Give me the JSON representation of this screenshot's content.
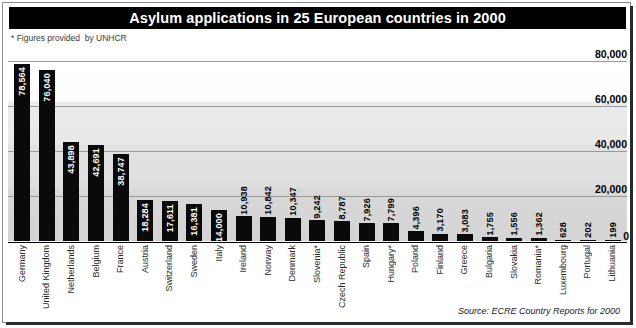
{
  "title": "Asylum applications in 25 European countries in 2000",
  "footnote": "* Figures provided  by UNHCR",
  "source": "Source: ECRE Country Reports for 2000",
  "chart_data": {
    "type": "bar",
    "title": "Asylum applications in 25 European countries in 2000",
    "xlabel": "",
    "ylabel": "",
    "ylim": [
      0,
      80000
    ],
    "yticks": [
      "0",
      "20,000",
      "40,000",
      "60,000",
      "80,000"
    ],
    "ytick_values": [
      0,
      20000,
      40000,
      60000,
      80000
    ],
    "grid": true,
    "legend": "none",
    "bar_color": "#0a0a0a",
    "categories": [
      "Germany",
      "United Kingdom",
      "Netherlands",
      "Belgium",
      "France",
      "Austria",
      "Switzerland",
      "Sweden",
      "Italy",
      "Ireland",
      "Norway",
      "Denmark",
      "Slovenia*",
      "Czech Republic",
      "Spain",
      "Hungary*",
      "Poland",
      "Finland",
      "Greece",
      "Bulgaria",
      "Slovakia",
      "Romania*",
      "Luxembourg",
      "Portugal",
      "Lithuania"
    ],
    "values": [
      78564,
      76040,
      43898,
      42691,
      38747,
      18284,
      17611,
      16381,
      14000,
      10938,
      10842,
      10347,
      9242,
      8787,
      7926,
      7799,
      4396,
      3170,
      3083,
      1755,
      1556,
      1362,
      628,
      202,
      199
    ],
    "value_labels": [
      "78,564",
      "76,040",
      "43,898",
      "42,691",
      "38,747",
      "18,284",
      "17,611",
      "16,381",
      "14,000",
      "10,938",
      "10,842",
      "10,347",
      "9,242",
      "8,787",
      "7,926",
      "7,799",
      "4,396",
      "3,170",
      "3,083",
      "1,755",
      "1,556",
      "1,362",
      "628",
      "202",
      "199"
    ],
    "label_placement": [
      "inside",
      "inside",
      "inside",
      "inside",
      "inside",
      "inside",
      "inside",
      "inside",
      "inside",
      "outside",
      "outside",
      "outside",
      "outside",
      "outside",
      "outside",
      "outside",
      "outside",
      "outside",
      "outside",
      "outside",
      "outside",
      "outside",
      "outside",
      "outside",
      "outside"
    ]
  }
}
